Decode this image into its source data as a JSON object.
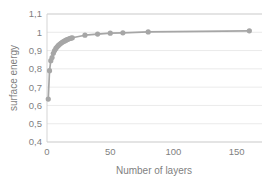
{
  "chart_data": {
    "type": "line",
    "title": "",
    "xlabel": "Number of layers",
    "ylabel": "surface energy",
    "xlim": [
      0,
      170
    ],
    "ylim": [
      0.4,
      1.1
    ],
    "grid": true,
    "legend": false,
    "decimal_separator": ",",
    "marker": "circle",
    "series_color": "#a6a6a6",
    "gridline_color": "#e4e4e4",
    "text_color": "#7f7f7f",
    "background_color": "#ffffff",
    "xticks": [
      0,
      50,
      100,
      150
    ],
    "xtick_labels": [
      "0",
      "50",
      "100",
      "150"
    ],
    "yticks": [
      0.4,
      0.5,
      0.6,
      0.7,
      0.8,
      0.9,
      1.0,
      1.1
    ],
    "ytick_labels": [
      "0,4",
      "0,5",
      "0,6",
      "0,7",
      "0,8",
      "0,9",
      "1",
      "1,1"
    ],
    "series": [
      {
        "name": "surface energy",
        "x": [
          1,
          2,
          3,
          4,
          5,
          6,
          7,
          8,
          9,
          10,
          11,
          12,
          13,
          14,
          15,
          16,
          17,
          18,
          19,
          20,
          30,
          40,
          50,
          60,
          80,
          160
        ],
        "values": [
          0.635,
          0.79,
          0.845,
          0.862,
          0.885,
          0.9,
          0.912,
          0.921,
          0.928,
          0.934,
          0.94,
          0.945,
          0.949,
          0.953,
          0.957,
          0.96,
          0.963,
          0.966,
          0.968,
          0.97,
          0.984,
          0.99,
          0.995,
          0.997,
          1.002,
          1.008
        ]
      }
    ]
  }
}
